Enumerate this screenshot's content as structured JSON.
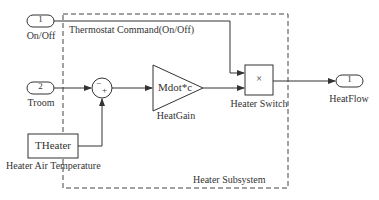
{
  "diagram": {
    "subsystem_label": "Heater Subsystem",
    "inports": [
      {
        "number": "1",
        "label": "On/Off"
      },
      {
        "number": "2",
        "label": "Troom"
      }
    ],
    "outports": [
      {
        "number": "1",
        "label": "HeatFlow"
      }
    ],
    "signals": {
      "thermostat": "Thermostat Command(On/Off)"
    },
    "blocks": {
      "sum": {
        "signs_top": "−",
        "signs_bottom": "+"
      },
      "gain": {
        "value": "Mdot*c",
        "label": "HeatGain"
      },
      "product": {
        "symbol": "×",
        "label": "Heater Switch"
      },
      "constant": {
        "value": "THeater",
        "label": "Heater Air Temperature"
      }
    }
  }
}
